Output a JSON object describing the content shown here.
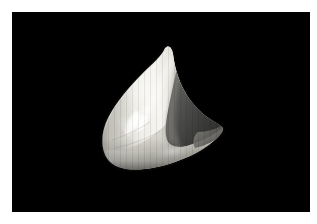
{
  "image": {
    "kind": "natural-photograph",
    "subject": "tooth-like pale specimen",
    "alt_text": "Close-up photograph of a pale cream-white triangular specimen on a black background",
    "width_px": 317,
    "height_px": 224,
    "frame": {
      "border_color": "#ffffff",
      "border_left_px": 12,
      "border_top_px": 12,
      "border_right_px": 7,
      "border_bottom_px": 12
    },
    "plate": {
      "background_color": "#000000",
      "x": 12,
      "y": 12,
      "width": 298,
      "height": 200
    },
    "palette": {
      "background": "#000000",
      "specimen_highlight": "#ffffff",
      "specimen_bright": "#f0efe9",
      "specimen_body": "#dedcd4",
      "specimen_midtone": "#b8b6ae",
      "specimen_shadow": "#6a6a66",
      "specimen_deep_shadow": "#353534",
      "specimen_edge_dark": "#1c1c1c",
      "frame": "#ffffff"
    },
    "specimen": {
      "bounds": {
        "x": 103,
        "y": 48,
        "width": 120,
        "height": 120
      },
      "apex": {
        "x": 165,
        "y": 48
      },
      "right_tip": {
        "x": 222,
        "y": 128
      },
      "notch": {
        "x": 180,
        "y": 63
      },
      "shadow_region_label": "right-facing shaded facet",
      "highlight_region_label": "lower-left specular highlight"
    }
  }
}
